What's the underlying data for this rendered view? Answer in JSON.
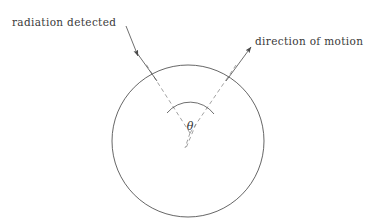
{
  "figure": {
    "background_color": "#ffffff",
    "line_color": "#4a4a4a",
    "dashed_line_color": "#8a8a8a",
    "text_color": "#3a3a3a"
  },
  "labels": {
    "radiation_detected": "radiation detected",
    "direction_of_motion": "direction of motion",
    "angle_symbol": "θ"
  },
  "geometry": {
    "circle": {
      "cx": 188,
      "cy": 141,
      "r": 76
    },
    "vertex": {
      "x": 190,
      "y": 133
    },
    "radiation_arrow": {
      "tail_x": 126,
      "tail_y": 26,
      "tip_x": 137,
      "tip_y": 54,
      "line_end_x": 156,
      "line_end_y": 80
    },
    "motion_arrow": {
      "tail_x": 226,
      "tail_y": 80,
      "tip_x": 252,
      "tip_y": 45
    },
    "dashed_left": {
      "x1": 156,
      "y1": 80,
      "x2": 190,
      "y2": 133
    },
    "dashed_right": {
      "x1": 226,
      "y1": 80,
      "x2": 190,
      "y2": 133
    },
    "dashed_tail": {
      "x1": 190,
      "y1": 133,
      "x2": 186,
      "y2": 147
    },
    "angle_arc": {
      "rx": 28,
      "ry": 26,
      "start_x": 168,
      "start_y": 112,
      "end_x": 213,
      "end_y": 113
    },
    "theta_label": {
      "x": 190,
      "y": 128
    }
  }
}
